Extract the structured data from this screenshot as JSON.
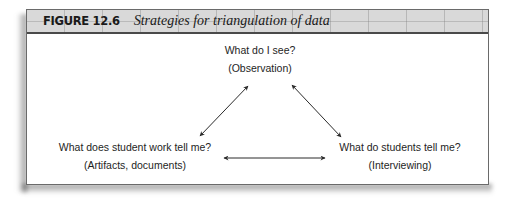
{
  "figure": {
    "label": "FIGURE 12.6",
    "title": "Strategies for triangulation of data"
  },
  "nodes": {
    "top": {
      "question": "What do I see?",
      "method": "(Observation)"
    },
    "left": {
      "question": "What does student work tell me?",
      "method": "(Artifacts, documents)"
    },
    "right": {
      "question": "What do students tell me?",
      "method": "(Interviewing)"
    }
  },
  "connections": [
    {
      "from": "top",
      "to": "left",
      "type": "double-arrow"
    },
    {
      "from": "top",
      "to": "right",
      "type": "double-arrow"
    },
    {
      "from": "left",
      "to": "right",
      "type": "double-arrow"
    }
  ],
  "colors": {
    "header_band": "#d9d9d9",
    "border": "#6a6a6a",
    "text": "#1e1e1e",
    "arrow": "#2a2a2a"
  }
}
